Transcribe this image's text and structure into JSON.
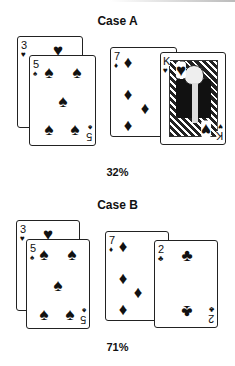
{
  "cases": [
    {
      "title": "Case A",
      "percentage": "32%",
      "hand_left": [
        {
          "rank": "3",
          "suit": "♥",
          "suit_name": "hearts"
        },
        {
          "rank": "5",
          "suit": "♠",
          "suit_name": "spades"
        }
      ],
      "hand_right": [
        {
          "rank": "7",
          "suit": "♦",
          "suit_name": "diamonds"
        },
        {
          "rank": "K",
          "suit": "♥",
          "suit_name": "hearts"
        }
      ]
    },
    {
      "title": "Case B",
      "percentage": "71%",
      "hand_left": [
        {
          "rank": "3",
          "suit": "♥",
          "suit_name": "hearts"
        },
        {
          "rank": "5",
          "suit": "♠",
          "suit_name": "spades"
        }
      ],
      "hand_right": [
        {
          "rank": "7",
          "suit": "♦",
          "suit_name": "diamonds"
        },
        {
          "rank": "2",
          "suit": "♣",
          "suit_name": "clubs"
        }
      ]
    }
  ]
}
